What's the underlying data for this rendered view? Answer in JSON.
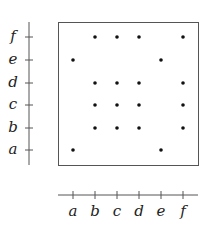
{
  "diagram": {
    "type": "relation-matrix-dot-plot",
    "elements": [
      "a",
      "b",
      "c",
      "d",
      "e",
      "f"
    ],
    "x_axis": {
      "labels": [
        "a",
        "b",
        "c",
        "d",
        "e",
        "f"
      ]
    },
    "y_axis": {
      "labels": [
        "a",
        "b",
        "c",
        "d",
        "e",
        "f"
      ]
    },
    "points": [
      {
        "x": "a",
        "y": "a"
      },
      {
        "x": "e",
        "y": "a"
      },
      {
        "x": "b",
        "y": "b"
      },
      {
        "x": "c",
        "y": "b"
      },
      {
        "x": "d",
        "y": "b"
      },
      {
        "x": "f",
        "y": "b"
      },
      {
        "x": "b",
        "y": "c"
      },
      {
        "x": "c",
        "y": "c"
      },
      {
        "x": "d",
        "y": "c"
      },
      {
        "x": "f",
        "y": "c"
      },
      {
        "x": "b",
        "y": "d"
      },
      {
        "x": "c",
        "y": "d"
      },
      {
        "x": "d",
        "y": "d"
      },
      {
        "x": "f",
        "y": "d"
      },
      {
        "x": "a",
        "y": "e"
      },
      {
        "x": "e",
        "y": "e"
      },
      {
        "x": "b",
        "y": "f"
      },
      {
        "x": "c",
        "y": "f"
      },
      {
        "x": "d",
        "y": "f"
      },
      {
        "x": "f",
        "y": "f"
      }
    ],
    "colors": {
      "line": "#555555",
      "dot": "#111111",
      "text": "#222222"
    }
  }
}
